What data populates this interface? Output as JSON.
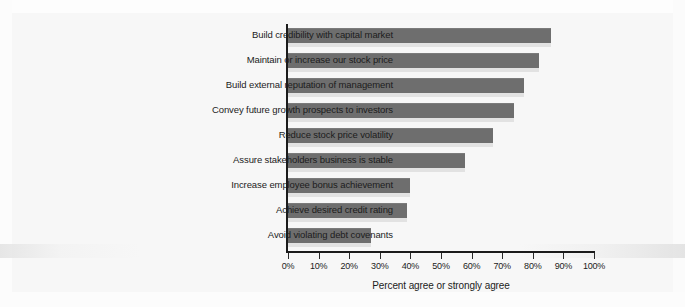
{
  "chart_data": {
    "type": "bar",
    "orientation": "horizontal",
    "title": "",
    "xlabel": "Percent agree or strongly agree",
    "ylabel": "",
    "xlim": [
      0,
      100
    ],
    "xtick_labels": [
      "0%",
      "10%",
      "20%",
      "30%",
      "40%",
      "50%",
      "60%",
      "70%",
      "80%",
      "90%",
      "100%"
    ],
    "xtick_values": [
      0,
      10,
      20,
      30,
      40,
      50,
      60,
      70,
      80,
      90,
      100
    ],
    "grid": false,
    "legend": "none",
    "units": "percent",
    "bar_color": "#6e6e6e",
    "categories": [
      "Build credibility with capital market",
      "Maintain or increase our stock price",
      "Build external reputation of management",
      "Convey future growth prospects to investors",
      "Reduce stock price volatility",
      "Assure stakeholders business is stable",
      "Increase employee bonus achievement",
      "Achieve desired credit rating",
      "Avoid violating debt covenants"
    ],
    "values": [
      86,
      82,
      77,
      74,
      67,
      58,
      40,
      39,
      27
    ]
  }
}
